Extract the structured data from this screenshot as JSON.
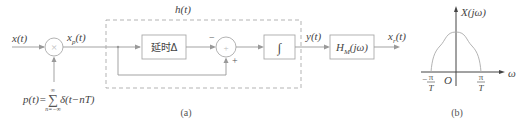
{
  "diagram_a": {
    "caption": "(a)",
    "input_label": "x(t)",
    "sampled_label_base": "x",
    "sampled_label_sub": "p",
    "sampled_label_tail": "(t)",
    "multiplier_symbol": "×",
    "impulse_train_label": "p(t)=",
    "impulse_sum_symbol": "∑",
    "impulse_sum_upper": "∞",
    "impulse_sum_lower": "n=−∞",
    "impulse_term": "δ(t−nT)",
    "system_label": "h(t)",
    "delay_block_label": "延时Δ",
    "summer_symbol": "+",
    "summer_minus_sign": "−",
    "summer_plus_sign": "+",
    "integrator_symbol": "∫",
    "intermediate_label": "y(t)",
    "filter_block_base": "H",
    "filter_block_sub": "M",
    "filter_block_tail": "(jω)",
    "output_label_base": "x",
    "output_label_sub": "r",
    "output_label_tail": "(t)"
  },
  "diagram_b": {
    "caption": "(b)",
    "y_axis_label": "X(jω)",
    "x_axis_label": "ω",
    "origin_label": "O",
    "left_tick_num": "π",
    "left_tick_den": "T",
    "left_tick_sign": "−",
    "right_tick_num": "π",
    "right_tick_den": "T",
    "curve_shape": "bell-shaped spectrum band-limited to [−π/T, π/T]"
  }
}
